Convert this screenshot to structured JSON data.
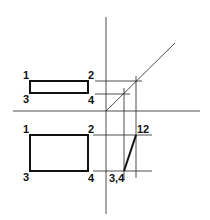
{
  "top_view": {
    "labels": [
      "1",
      "2",
      "3",
      "4"
    ]
  },
  "front_view": {
    "labels": [
      "1",
      "2",
      "3",
      "4"
    ]
  },
  "side_view": {
    "labels": [
      "12",
      "3,4"
    ]
  },
  "colors": {
    "line": "#111111",
    "background": "#ffffff"
  }
}
